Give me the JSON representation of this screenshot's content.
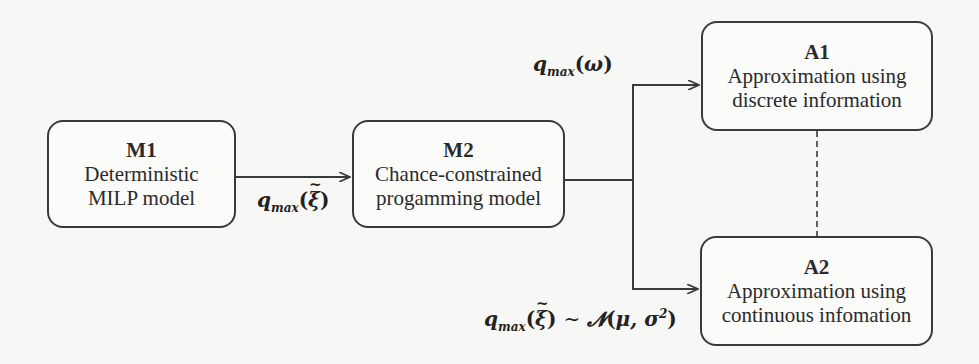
{
  "nodes": {
    "m1": {
      "title": "M1",
      "line1": "Deterministic",
      "line2": "MILP model"
    },
    "m2": {
      "title": "M2",
      "line1": "Chance-constrained",
      "line2": "progamming model"
    },
    "a1": {
      "title": "A1",
      "line1": "Approximation using",
      "line2": "discrete information"
    },
    "a2": {
      "title": "A2",
      "line1": "Approximation using",
      "line2": "continuous infomation"
    }
  },
  "edges": {
    "m1_m2": {
      "var": "q",
      "sub": "max",
      "arg": "ξ"
    },
    "to_a1": {
      "var": "q",
      "sub": "max",
      "arg": "ω"
    },
    "to_a2": {
      "var": "q",
      "sub": "max",
      "arg": "ξ",
      "dist_sym": "∼",
      "dist": "𝓝",
      "params_mu": "μ, σ",
      "params_exp": "2"
    }
  },
  "links": {
    "a1_a2": "dashed"
  },
  "colors": {
    "line": "#3a3a3a",
    "background": "#f7f7f5"
  }
}
